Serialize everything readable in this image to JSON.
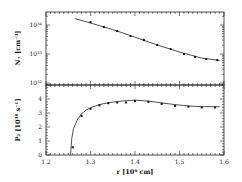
{
  "chart_data": [
    {
      "type": "line",
      "panel": "top",
      "title": "",
      "xlabel": "",
      "ylabel": "N₊ [cm⁻³]",
      "yscale": "log",
      "ylim_log10": [
        31.93,
        34.45
      ],
      "xlim": [
        1.2,
        1.6
      ],
      "ytick_labels": [
        "10³⁴",
        "10³³",
        "10³²"
      ],
      "ytick_values_log10": [
        34,
        33,
        32
      ],
      "series": [
        {
          "name": "model curve",
          "style": "line",
          "x": [
            1.265,
            1.3,
            1.35,
            1.4,
            1.45,
            1.5,
            1.55,
            1.59
          ],
          "log10_y": [
            34.22,
            34.07,
            33.84,
            33.58,
            33.31,
            33.07,
            32.86,
            32.78
          ]
        },
        {
          "name": "data points",
          "style": "markers",
          "x": [
            1.3,
            1.33,
            1.36,
            1.39,
            1.42,
            1.45,
            1.48,
            1.51,
            1.535,
            1.56,
            1.585
          ],
          "log10_y": [
            34.1,
            33.93,
            33.79,
            33.62,
            33.48,
            33.31,
            33.17,
            33.0,
            32.9,
            32.83,
            32.79
          ]
        }
      ]
    },
    {
      "type": "line",
      "panel": "bottom",
      "title": "",
      "xlabel": "r [10⁶ cm]",
      "ylabel": "P₂ [10³⁸ s⁻¹]",
      "ylim": [
        0,
        5
      ],
      "xlim": [
        1.2,
        1.6
      ],
      "ytick_labels": [
        "0",
        "1",
        "2",
        "3",
        "4"
      ],
      "xtick_labels": [
        "1.2",
        "1.3",
        "1.4",
        "1.5",
        "1.6"
      ],
      "series": [
        {
          "name": "model curve",
          "style": "line",
          "x": [
            1.255,
            1.258,
            1.262,
            1.27,
            1.28,
            1.29,
            1.3,
            1.32,
            1.34,
            1.36,
            1.38,
            1.4,
            1.43,
            1.46,
            1.49,
            1.52,
            1.55,
            1.59
          ],
          "y": [
            0,
            1.2,
            1.9,
            2.5,
            2.95,
            3.2,
            3.38,
            3.6,
            3.73,
            3.82,
            3.88,
            3.92,
            3.85,
            3.72,
            3.6,
            3.5,
            3.45,
            3.45
          ]
        },
        {
          "name": "data points",
          "style": "markers",
          "x": [
            1.26,
            1.28,
            1.3,
            1.32,
            1.34,
            1.36,
            1.38,
            1.4,
            1.43,
            1.46,
            1.49,
            1.52,
            1.55,
            1.58
          ],
          "y": [
            0.55,
            2.8,
            3.3,
            3.55,
            3.7,
            3.75,
            3.75,
            3.85,
            3.8,
            3.65,
            3.5,
            3.45,
            3.4,
            3.4
          ]
        }
      ]
    }
  ],
  "labels": {
    "top_ylabel": "N₊ [cm⁻³]",
    "bottom_ylabel": "P₂ [10³⁸ s⁻¹]",
    "xlabel": "r [10⁶ cm]",
    "top_yticks": [
      "10³⁴",
      "10³³",
      "10³²"
    ],
    "bottom_yticks": [
      "0",
      "1",
      "2",
      "3",
      "4"
    ],
    "xticks": [
      "1.2",
      "1.3",
      "1.4",
      "1.5",
      "1.6"
    ]
  }
}
